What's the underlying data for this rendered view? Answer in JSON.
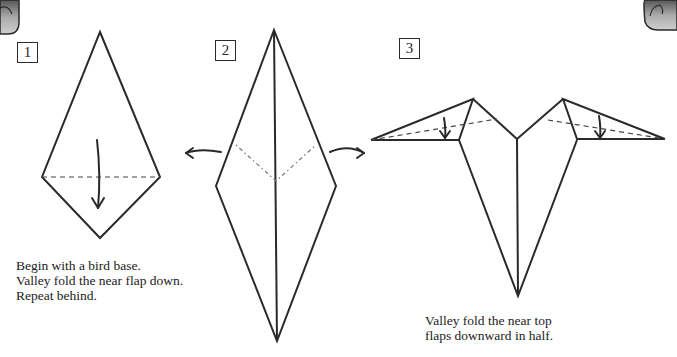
{
  "steps": [
    {
      "number": "1",
      "caption": "Begin with a bird base.\nValley fold the near flap down.\nRepeat behind."
    },
    {
      "number": "2",
      "caption": ""
    },
    {
      "number": "3",
      "caption": "Valley fold the near top\nflaps downward in half."
    }
  ],
  "icons": {
    "corner_left": "page-corner-tab-icon",
    "corner_right": "page-corner-tab-icon"
  },
  "colors": {
    "line": "#2a2a2a",
    "background": "#ffffff",
    "tab_fill": "#9a9a9a"
  }
}
